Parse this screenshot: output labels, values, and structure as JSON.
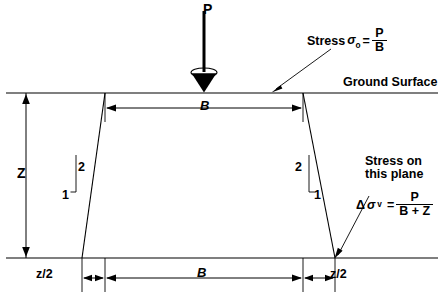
{
  "figure": {
    "type": "engineering-diagram"
  },
  "labels": {
    "load": "P",
    "stress_prefix": "Stress",
    "sigma_symbol": "σ",
    "sigma_subscript": "o",
    "equals": "=",
    "sigma_num": "P",
    "sigma_den": "B",
    "ground_surface": "Ground Surface",
    "width_top": "B",
    "depth": "Z",
    "slope_vertical_left": "2",
    "slope_horizontal_left": "1",
    "slope_vertical_right": "2",
    "slope_horizontal_right": "1",
    "stress_plane_line1": "Stress on",
    "stress_plane_line2": "this plane",
    "delta_symbol": "Δ",
    "delta_sigma_symbol": "σ",
    "delta_sigma_subscript": "v",
    "delta_num": "P",
    "delta_den": "B + Z",
    "dim_left": "z/2",
    "dim_middle": "B",
    "dim_right": "z/2"
  },
  "colors": {
    "line": "#000000",
    "background": "#ffffff",
    "text": "#000000"
  },
  "geometry": {
    "ground_surface_y": 93,
    "base_y": 258,
    "footing_left_x": 105,
    "footing_right_x": 303,
    "spread_left_x": 82,
    "spread_right_x": 335,
    "load_x": 204
  }
}
